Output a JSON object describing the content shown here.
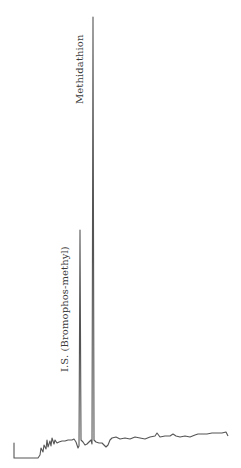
{
  "chart_data": {
    "type": "line",
    "title": "",
    "xlabel": "",
    "ylabel": "",
    "grid": false,
    "legend": null,
    "peaks": [
      {
        "name": "I.S. (Bromophos-methyl)",
        "x_px": 80,
        "apex_y_px": 230,
        "relative_height": 0.5
      },
      {
        "name": "Methidathion",
        "x_px": 93,
        "apex_y_px": 17,
        "relative_height": 1.0
      }
    ],
    "trace_points": [
      [
        14,
        458
      ],
      [
        14,
        443
      ],
      [
        14,
        458
      ],
      [
        38,
        458
      ],
      [
        40,
        455
      ],
      [
        41,
        448
      ],
      [
        43,
        452
      ],
      [
        44,
        445
      ],
      [
        46,
        449
      ],
      [
        47,
        440
      ],
      [
        48,
        447
      ],
      [
        50,
        441
      ],
      [
        51,
        446
      ],
      [
        52,
        438
      ],
      [
        54,
        444
      ],
      [
        55,
        440
      ],
      [
        57,
        443
      ],
      [
        59,
        442
      ],
      [
        62,
        441
      ],
      [
        65,
        441
      ],
      [
        68,
        440
      ],
      [
        72,
        440
      ],
      [
        74,
        439
      ],
      [
        76,
        442
      ],
      [
        78,
        448
      ],
      [
        79,
        446
      ],
      [
        80,
        230
      ],
      [
        81,
        440
      ],
      [
        83,
        442
      ],
      [
        85,
        445
      ],
      [
        87,
        444
      ],
      [
        89,
        442
      ],
      [
        91,
        440
      ],
      [
        92,
        444
      ],
      [
        93,
        17
      ],
      [
        94,
        440
      ],
      [
        96,
        442
      ],
      [
        99,
        443
      ],
      [
        102,
        443
      ],
      [
        104,
        445
      ],
      [
        106,
        447
      ],
      [
        108,
        445
      ],
      [
        110,
        440
      ],
      [
        112,
        438
      ],
      [
        116,
        437
      ],
      [
        120,
        439
      ],
      [
        125,
        438
      ],
      [
        130,
        439
      ],
      [
        135,
        437
      ],
      [
        140,
        438
      ],
      [
        145,
        439
      ],
      [
        150,
        437
      ],
      [
        155,
        436
      ],
      [
        157,
        433
      ],
      [
        160,
        437
      ],
      [
        165,
        436
      ],
      [
        170,
        436
      ],
      [
        173,
        434
      ],
      [
        176,
        436
      ],
      [
        180,
        437
      ],
      [
        185,
        436
      ],
      [
        190,
        437
      ],
      [
        195,
        435
      ],
      [
        198,
        434
      ],
      [
        202,
        434
      ],
      [
        207,
        434
      ],
      [
        212,
        433
      ],
      [
        217,
        433
      ],
      [
        222,
        433
      ],
      [
        226,
        432
      ],
      [
        228,
        436
      ]
    ]
  },
  "labels": {
    "is_peak": "I.S. (Bromophos-methyl)",
    "main_peak": "Methidathion"
  },
  "colors": {
    "trace": "#555555",
    "text": "#3a3a3a"
  }
}
